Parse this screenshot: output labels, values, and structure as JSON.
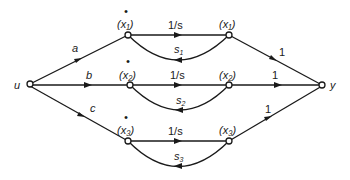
{
  "diagram": {
    "type": "signal-flow-graph",
    "nodes": {
      "input": "u",
      "output": "y",
      "rows": [
        {
          "derivative_label": "(x₁)",
          "derivative_dot": "•",
          "state_label": "(x₁)",
          "forward_gain": "1/s",
          "feedback_gain": "s",
          "feedback_sub": "1",
          "input_gain": "a",
          "output_gain": "1"
        },
        {
          "derivative_label": "(x₂)",
          "derivative_dot": "•",
          "state_label": "(x₂)",
          "forward_gain": "1/s",
          "feedback_gain": "s",
          "feedback_sub": "2",
          "input_gain": "b",
          "output_gain": "1"
        },
        {
          "derivative_label": "(x₃)",
          "derivative_dot": "•",
          "state_label": "(x₃)",
          "forward_gain": "1/s",
          "feedback_gain": "s",
          "feedback_sub": "3",
          "input_gain": "c",
          "output_gain": "1"
        }
      ]
    }
  }
}
